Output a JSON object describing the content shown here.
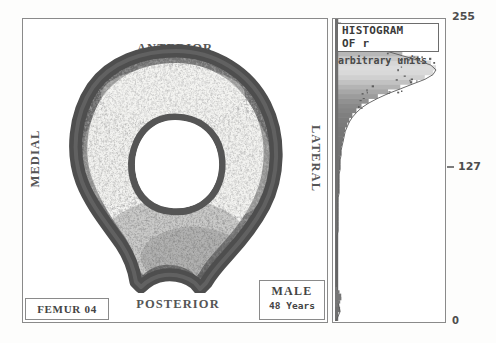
{
  "figure": {
    "background_color": "#fdfdfc",
    "ink_color": "#555555"
  },
  "ct_panel": {
    "name": "bone-cross-section",
    "orientation_labels": {
      "top": "ANTERIOR",
      "bottom": "POSTERIOR",
      "left": "MEDIAL",
      "right": "LATERAL"
    },
    "specimen_box": {
      "label": "FEMUR 04"
    },
    "subject_box": {
      "sex": "MALE",
      "age": "48 Years"
    }
  },
  "histogram_panel": {
    "title_line_1": "HISTOGRAM",
    "title_line_2": "OF r",
    "subtitle": "arbitrary units",
    "axis_ticks": [
      "255",
      "127",
      "0"
    ],
    "tick_top": "255",
    "tick_mid": "127",
    "tick_bottom": "0"
  },
  "chart_data": {
    "type": "bar",
    "title": "HISTOGRAM OF r",
    "subtitle": "arbitrary units",
    "xlabel": "arbitrary units",
    "ylabel": "r (grey level)",
    "orientation": "horizontal",
    "ylim": [
      0,
      255
    ],
    "xlim": [
      0,
      100
    ],
    "grid": false,
    "legend": false,
    "y_tick_values": [
      0,
      127,
      255
    ],
    "y_tick_labels": [
      "0",
      "127",
      "255"
    ],
    "note": "Counts are in arbitrary units; bars extend rightward from the left axis. Grey level r on the vertical axis runs 0 (bottom) to 255 (top).",
    "bins": [
      0,
      4,
      8,
      12,
      16,
      20,
      24,
      28,
      32,
      36,
      40,
      44,
      48,
      52,
      56,
      60,
      64,
      68,
      72,
      76,
      80,
      84,
      88,
      92,
      96,
      100,
      104,
      108,
      112,
      116,
      120,
      124,
      128,
      132,
      136,
      140,
      144,
      148,
      152,
      156,
      160,
      164,
      168,
      172,
      176,
      180,
      184,
      188,
      192,
      196,
      200,
      204,
      208,
      212,
      216,
      220,
      224,
      228,
      232,
      236,
      240,
      244,
      248,
      252
    ],
    "counts": [
      1,
      3,
      5,
      4,
      3,
      2,
      2,
      2,
      2,
      2,
      2,
      2,
      2,
      2,
      2,
      2,
      2,
      2,
      2,
      3,
      3,
      3,
      3,
      3,
      3,
      3,
      3,
      4,
      4,
      4,
      4,
      4,
      5,
      5,
      5,
      6,
      6,
      7,
      8,
      9,
      10,
      12,
      14,
      17,
      21,
      26,
      33,
      42,
      52,
      64,
      76,
      88,
      96,
      99,
      94,
      82,
      66,
      50,
      36,
      25,
      16,
      10,
      6,
      3
    ],
    "peak_bin": 212,
    "peak_count": 99
  }
}
